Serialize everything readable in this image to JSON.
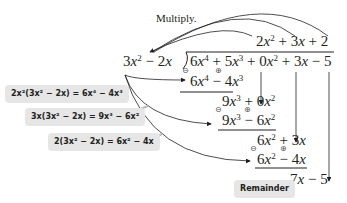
{
  "title": "Multiply.",
  "division": {
    "quotient": "2x^2 + 3x + 2",
    "divisor": "3x^2 - 2x",
    "dividend": "6x^4 + 5x^3 + 0x^2 + 3x - 5",
    "steps": [
      {
        "subtract": "6x^4 - 4x^3",
        "result": "9x^3 + 0x^2"
      },
      {
        "subtract": "9x^3 - 6x^2",
        "result": "6x^2 + 3x"
      },
      {
        "subtract": "6x^2 - 4x",
        "result": "7x - 5"
      }
    ]
  },
  "labels": {
    "step1": "2x²(3x² − 2x) = 6x⁴ − 4x³",
    "step2": "3x(3x² − 2x) = 9x³ − 6x²",
    "step3": "2(3x² − 2x) = 6x² − 4x",
    "remainder": "Remainder"
  },
  "signs": {
    "minus": "⊖",
    "plus": "⊕"
  },
  "colors": {
    "label_bg": "#e6e6e6",
    "text": "#231f20",
    "arrow": "#231f20"
  }
}
